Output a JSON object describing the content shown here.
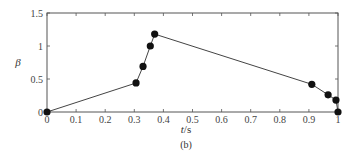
{
  "chart_data": {
    "type": "line",
    "title": "",
    "caption": "(b)",
    "xlabel": "t/s",
    "xlabel_italic_part": "t",
    "xlabel_unit_part": "/s",
    "ylabel": "β",
    "xlim": [
      0,
      1
    ],
    "ylim": [
      0,
      1.5
    ],
    "grid": false,
    "legend": null,
    "x_ticks": [
      0,
      0.1,
      0.2,
      0.3,
      0.4,
      0.5,
      0.6,
      0.7,
      0.8,
      0.9,
      1
    ],
    "x_tick_labels": [
      "0",
      "0.1",
      "0.2",
      "0.3",
      "0.4",
      "0.5",
      "0.6",
      "0.7",
      "0.8",
      "0.9",
      "1"
    ],
    "y_ticks": [
      0,
      0.5,
      1,
      1.5
    ],
    "y_tick_labels": [
      "0",
      "0.5",
      "1",
      "1.5"
    ],
    "series": [
      {
        "name": "β",
        "color": "#333333",
        "marker": "filled-circle",
        "x": [
          0,
          0.306,
          0.33,
          0.355,
          0.37,
          0.91,
          0.966,
          0.993,
          1.0
        ],
        "y": [
          0,
          0.44,
          0.69,
          1.0,
          1.18,
          0.42,
          0.26,
          0.18,
          0
        ]
      }
    ]
  },
  "style": {
    "axis_color": "#555555",
    "line_color": "#444444",
    "marker_color": "#111111"
  }
}
